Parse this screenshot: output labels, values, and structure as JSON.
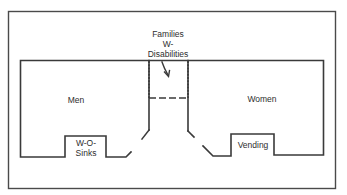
{
  "diagram": {
    "type": "floor-plan",
    "rooms": [
      {
        "id": "men",
        "label": "Men"
      },
      {
        "id": "women",
        "label": "Women"
      },
      {
        "id": "families",
        "label_lines": [
          "Families",
          "W-",
          "Disabilities"
        ]
      },
      {
        "id": "sinks",
        "label_lines": [
          "W-O-",
          "Sinks"
        ]
      },
      {
        "id": "vending",
        "label": "Vending"
      }
    ],
    "annotations": {
      "arrow": "points from Families W- Disabilities label into center room"
    },
    "colors": {
      "line": "#3a3a3a",
      "background": "#ffffff"
    }
  }
}
